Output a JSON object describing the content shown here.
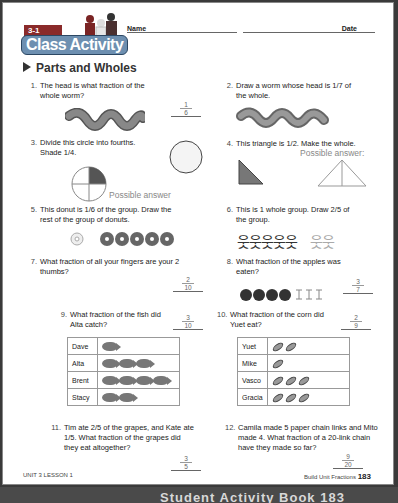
{
  "header": {
    "lesson_badge": "3-1",
    "activity_title": "Class Activity",
    "name_label": "Name",
    "date_label": "Date"
  },
  "section": {
    "title": "Parts and Wholes"
  },
  "questions": [
    {
      "num": "1.",
      "text": "The head is what fraction of the whole worm?",
      "answer_num": "1",
      "answer_den": "6"
    },
    {
      "num": "2.",
      "text": "Draw a worm whose head is 1/7 of the whole."
    },
    {
      "num": "3.",
      "text": "Divide this circle into fourths. Shade 1/4.",
      "note": "Possible answer"
    },
    {
      "num": "4.",
      "text": "This triangle is 1/2. Make the whole.",
      "note": "Possible answer:"
    },
    {
      "num": "5.",
      "text": "This donut is 1/6 of the group. Draw the rest of the group of donuts."
    },
    {
      "num": "6.",
      "text": "This is 1 whole group. Draw 2/5 of the group."
    },
    {
      "num": "7.",
      "text": "What fraction of all your fingers are your 2 thumbs?",
      "answer_num": "2",
      "answer_den": "10"
    },
    {
      "num": "8.",
      "text": "What fraction of the apples was eaten?",
      "answer_num": "3",
      "answer_den": "7"
    },
    {
      "num": "9.",
      "text": "What fraction of the fish did Alta catch?",
      "answer_num": "3",
      "answer_den": "10"
    },
    {
      "num": "10.",
      "text": "What fraction of the corn did Yuet eat?",
      "answer_num": "2",
      "answer_den": "9"
    },
    {
      "num": "11.",
      "text": "Tim ate 2/5 of the grapes, and Kate ate 1/5. What fraction of the grapes did they eat altogether?",
      "answer_num": "3",
      "answer_den": "5"
    },
    {
      "num": "12.",
      "text": "Camila made 5 paper chain links and Mito made 4. What fraction of a 20-link chain have they made so far?",
      "answer_num": "9",
      "answer_den": "20"
    }
  ],
  "fish_table": [
    {
      "name": "Dave",
      "count": 1
    },
    {
      "name": "Alta",
      "count": 3
    },
    {
      "name": "Brent",
      "count": 4
    },
    {
      "name": "Stacy",
      "count": 2
    }
  ],
  "corn_table": [
    {
      "name": "Yuet",
      "count": 2
    },
    {
      "name": "Mike",
      "count": 1
    },
    {
      "name": "Vasco",
      "count": 3
    },
    {
      "name": "Gracia",
      "count": 3
    }
  ],
  "footer": {
    "left": "UNIT 3 LESSON 1",
    "right_label": "Build Unit Fractions",
    "page_number": "183"
  },
  "bottom_bar": {
    "text": "Student Activity Book 183"
  },
  "colors": {
    "badge": "#8a2a2a",
    "logo": "#6d8fb0",
    "ink": "#222222"
  }
}
